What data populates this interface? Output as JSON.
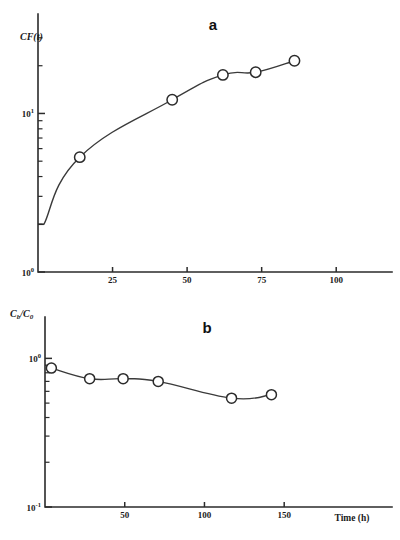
{
  "figure": {
    "width": 400,
    "height": 540,
    "background": "#ffffff",
    "ink_color": "#2b2b2b"
  },
  "chart_data": [
    {
      "id": "panel-a",
      "type": "line",
      "panel_label": "a",
      "title": "",
      "xlabel": "",
      "ylabel": "CF(t)",
      "ylabel_parts": {
        "main": "CF(",
        "italic_var": "t",
        "close": ")"
      },
      "xscale": "linear",
      "yscale": "log",
      "xlim": [
        0,
        112
      ],
      "ylim": [
        1,
        40
      ],
      "xticks": [
        25,
        50,
        75,
        100
      ],
      "xticklabels": [
        "25",
        "50",
        "75",
        "100"
      ],
      "yticks": [
        1,
        10
      ],
      "yticklabels": [
        "10⁰",
        "10¹"
      ],
      "yticklabels_parts": [
        {
          "base": "10",
          "exp": "0"
        },
        {
          "base": "10",
          "exp": "1"
        }
      ],
      "yminorticks": [
        2,
        3,
        4,
        5,
        6,
        7,
        8,
        9,
        20,
        30
      ],
      "grid": false,
      "legend": false,
      "marker": "open-circle",
      "x": [
        14,
        45,
        62,
        73,
        86
      ],
      "y": [
        5.3,
        12.2,
        17.5,
        18.2,
        21.5
      ],
      "curve_start": {
        "x": 2.0,
        "y": 2.0
      },
      "start_marker": true,
      "points": [
        {
          "x": 14,
          "y": 5.3
        },
        {
          "x": 45,
          "y": 12.2
        },
        {
          "x": 62,
          "y": 17.5
        },
        {
          "x": 73,
          "y": 18.2
        },
        {
          "x": 86,
          "y": 21.5
        }
      ]
    },
    {
      "id": "panel-b",
      "type": "line",
      "panel_label": "b",
      "title": "",
      "xlabel": "Time (h)",
      "ylabel": "Cb/C0",
      "ylabel_parts": {
        "num": "C",
        "num_sub": "b",
        "slash": "/",
        "den": "C",
        "den_sub": "0"
      },
      "xscale": "linear",
      "yscale": "log",
      "xlim": [
        0,
        185
      ],
      "ylim": [
        0.1,
        1.35
      ],
      "xticks": [
        50,
        100,
        150
      ],
      "xticklabels": [
        "50",
        "100",
        "150"
      ],
      "yticks": [
        0.1,
        1
      ],
      "yticklabels": [
        "10⁻¹",
        "10⁰"
      ],
      "yticklabels_parts": [
        {
          "base": "10",
          "exp": "-1"
        },
        {
          "base": "10",
          "exp": "0"
        }
      ],
      "yminorticks": [
        0.2,
        0.3,
        0.4,
        0.5,
        0.6,
        0.7,
        0.8,
        0.9
      ],
      "grid": false,
      "legend": false,
      "marker": "open-circle",
      "x": [
        4,
        28,
        49,
        71,
        117,
        142
      ],
      "y": [
        0.86,
        0.73,
        0.73,
        0.7,
        0.54,
        0.57
      ],
      "points": [
        {
          "x": 4,
          "y": 0.86
        },
        {
          "x": 28,
          "y": 0.73
        },
        {
          "x": 49,
          "y": 0.73
        },
        {
          "x": 71,
          "y": 0.7
        },
        {
          "x": 117,
          "y": 0.54
        },
        {
          "x": 142,
          "y": 0.57
        }
      ]
    }
  ]
}
